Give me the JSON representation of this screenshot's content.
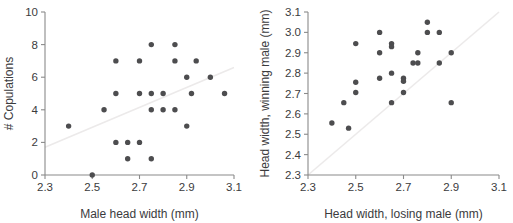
{
  "figure": {
    "background": "#ffffff",
    "point_color": "#4d4d4f",
    "line_color": "#eceaea",
    "axis_color": "#8a8a8a",
    "text_color": "#3b3b3d"
  },
  "chart_data": [
    {
      "type": "scatter",
      "panel": "left",
      "title": "",
      "xlabel": "Male head width (mm)",
      "ylabel": "# Copulations",
      "xlim": [
        2.3,
        3.1
      ],
      "ylim": [
        0,
        10
      ],
      "xticks": [
        2.3,
        2.5,
        2.7,
        2.9,
        3.1
      ],
      "xticklabels": [
        "2.3",
        "2.5",
        "2.7",
        "2.9",
        "3.1"
      ],
      "yticks": [
        0,
        2,
        4,
        6,
        8,
        10
      ],
      "yticklabels": [
        "0",
        "2",
        "4",
        "6",
        "8",
        "10"
      ],
      "grid": false,
      "legend": "none",
      "trendline": {
        "kind": "linear-fit",
        "x": [
          2.3,
          3.1
        ],
        "y": [
          1.7,
          6.6
        ]
      },
      "points": [
        {
          "x": 2.4,
          "y": 3
        },
        {
          "x": 2.5,
          "y": 0
        },
        {
          "x": 2.55,
          "y": 4
        },
        {
          "x": 2.6,
          "y": 7
        },
        {
          "x": 2.6,
          "y": 5
        },
        {
          "x": 2.6,
          "y": 2
        },
        {
          "x": 2.65,
          "y": 2
        },
        {
          "x": 2.65,
          "y": 1
        },
        {
          "x": 2.7,
          "y": 7
        },
        {
          "x": 2.7,
          "y": 5
        },
        {
          "x": 2.7,
          "y": 2
        },
        {
          "x": 2.75,
          "y": 8
        },
        {
          "x": 2.75,
          "y": 5
        },
        {
          "x": 2.75,
          "y": 4
        },
        {
          "x": 2.75,
          "y": 1
        },
        {
          "x": 2.8,
          "y": 5
        },
        {
          "x": 2.8,
          "y": 4
        },
        {
          "x": 2.85,
          "y": 8
        },
        {
          "x": 2.85,
          "y": 7
        },
        {
          "x": 2.85,
          "y": 4
        },
        {
          "x": 2.9,
          "y": 6
        },
        {
          "x": 2.9,
          "y": 3
        },
        {
          "x": 2.92,
          "y": 5
        },
        {
          "x": 2.94,
          "y": 7
        },
        {
          "x": 3.0,
          "y": 6
        },
        {
          "x": 3.06,
          "y": 5
        }
      ]
    },
    {
      "type": "scatter",
      "panel": "right",
      "title": "",
      "xlabel": "Head width, losing male (mm)",
      "ylabel": "Head width, winning male (mm)",
      "xlim": [
        2.3,
        3.1
      ],
      "ylim": [
        2.3,
        3.1
      ],
      "xticks": [
        2.3,
        2.5,
        2.7,
        2.9,
        3.1
      ],
      "xticklabels": [
        "2.3",
        "2.5",
        "2.7",
        "2.9",
        "3.1"
      ],
      "yticks": [
        2.3,
        2.4,
        2.5,
        2.6,
        2.7,
        2.8,
        2.9,
        3.0,
        3.1
      ],
      "yticklabels": [
        "2.3",
        "2.4",
        "2.5",
        "2.6",
        "2.7",
        "2.8",
        "2.9",
        "3.0",
        "3.1"
      ],
      "grid": false,
      "legend": "none",
      "trendline": {
        "kind": "identity-reference",
        "x": [
          2.3,
          3.1
        ],
        "y": [
          2.3,
          3.1
        ]
      },
      "points": [
        {
          "x": 2.4,
          "y": 2.555
        },
        {
          "x": 2.45,
          "y": 2.655
        },
        {
          "x": 2.47,
          "y": 2.53
        },
        {
          "x": 2.5,
          "y": 2.945
        },
        {
          "x": 2.5,
          "y": 2.755
        },
        {
          "x": 2.5,
          "y": 2.705
        },
        {
          "x": 2.6,
          "y": 3.0
        },
        {
          "x": 2.6,
          "y": 2.9
        },
        {
          "x": 2.6,
          "y": 2.775
        },
        {
          "x": 2.65,
          "y": 2.945
        },
        {
          "x": 2.65,
          "y": 2.93
        },
        {
          "x": 2.65,
          "y": 2.8
        },
        {
          "x": 2.65,
          "y": 2.655
        },
        {
          "x": 2.7,
          "y": 2.775
        },
        {
          "x": 2.7,
          "y": 2.76
        },
        {
          "x": 2.7,
          "y": 2.705
        },
        {
          "x": 2.74,
          "y": 2.85
        },
        {
          "x": 2.76,
          "y": 2.9
        },
        {
          "x": 2.76,
          "y": 2.85
        },
        {
          "x": 2.8,
          "y": 3.05
        },
        {
          "x": 2.8,
          "y": 3.0
        },
        {
          "x": 2.85,
          "y": 3.0
        },
        {
          "x": 2.85,
          "y": 2.85
        },
        {
          "x": 2.9,
          "y": 2.9
        },
        {
          "x": 2.9,
          "y": 2.655
        }
      ]
    }
  ]
}
